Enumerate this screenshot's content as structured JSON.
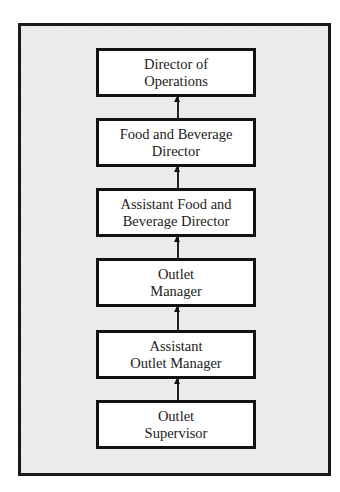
{
  "diagram": {
    "type": "org-chart",
    "direction": "bottom-to-top",
    "nodes": [
      {
        "id": "director-of-operations",
        "lines": [
          "Director of",
          "Operations"
        ]
      },
      {
        "id": "food-and-beverage-director",
        "lines": [
          "Food and Beverage",
          "Director"
        ]
      },
      {
        "id": "assistant-food-and-beverage-director",
        "lines": [
          "Assistant Food and",
          "Beverage Director"
        ]
      },
      {
        "id": "outlet-manager",
        "lines": [
          "Outlet",
          "Manager"
        ]
      },
      {
        "id": "assistant-outlet-manager",
        "lines": [
          "Assistant",
          "Outlet Manager"
        ]
      },
      {
        "id": "outlet-supervisor",
        "lines": [
          "Outlet",
          "Supervisor"
        ]
      }
    ],
    "edges": [
      {
        "from": "food-and-beverage-director",
        "to": "director-of-operations"
      },
      {
        "from": "assistant-food-and-beverage-director",
        "to": "food-and-beverage-director"
      },
      {
        "from": "outlet-manager",
        "to": "assistant-food-and-beverage-director"
      },
      {
        "from": "assistant-outlet-manager",
        "to": "outlet-manager"
      },
      {
        "from": "outlet-supervisor",
        "to": "assistant-outlet-manager"
      }
    ],
    "colors": {
      "frame_background": "#ececec",
      "box_background": "#ffffff",
      "border": "#111111",
      "text": "#222222"
    }
  }
}
